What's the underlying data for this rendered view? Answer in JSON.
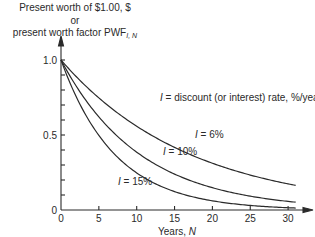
{
  "chart_data": {
    "type": "line",
    "title": "",
    "ylabel_lines": [
      "Present worth of $1.00, $",
      "or",
      "present worth factor PWF"
    ],
    "ylabel_subscript": "I, N",
    "xlabel": "Years, N",
    "annotation": "I = discount (or interest) rate, %/year",
    "x_ticks": [
      0,
      5,
      10,
      15,
      20,
      25,
      30
    ],
    "y_tick_labels": [
      "0",
      "0.5",
      "1.0"
    ],
    "y_minor_step": 0.1,
    "xlim": [
      0,
      32
    ],
    "ylim": [
      0,
      1.0
    ],
    "grid": false,
    "legend": "inline labels",
    "x": [
      0,
      5,
      10,
      15,
      20,
      25,
      30,
      31
    ],
    "series": [
      {
        "name": "I = 6%",
        "values": [
          1.0,
          0.747,
          0.558,
          0.417,
          0.312,
          0.233,
          0.174,
          0.164
        ]
      },
      {
        "name": "I = 10%",
        "values": [
          1.0,
          0.621,
          0.386,
          0.239,
          0.149,
          0.092,
          0.057,
          0.052
        ]
      },
      {
        "name": "I = 15%",
        "values": [
          1.0,
          0.497,
          0.247,
          0.123,
          0.061,
          0.03,
          0.015,
          0.013
        ]
      }
    ]
  }
}
